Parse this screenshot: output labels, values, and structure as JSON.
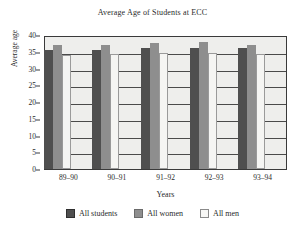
{
  "chart_data": {
    "type": "bar",
    "title": "Average Age of Students at ECC",
    "xlabel": "Years",
    "ylabel": "Average age",
    "categories": [
      "89–90",
      "90–91",
      "91–92",
      "92–93",
      "93–94"
    ],
    "series": [
      {
        "name": "All students",
        "color": "#4f4f4f",
        "values": [
          35.6,
          35.6,
          36.0,
          36.0,
          36.0
        ]
      },
      {
        "name": "All women",
        "color": "#8e8e8e",
        "values": [
          37.0,
          37.0,
          37.7,
          37.8,
          37.0
        ]
      },
      {
        "name": "All men",
        "color": "#f5f5f3",
        "values": [
          34.0,
          34.2,
          34.5,
          34.5,
          34.3
        ]
      }
    ],
    "ylim": [
      0,
      40
    ],
    "yticks": [
      0,
      5,
      10,
      15,
      20,
      25,
      30,
      35,
      40
    ],
    "grid": true,
    "legend_position": "bottom"
  }
}
